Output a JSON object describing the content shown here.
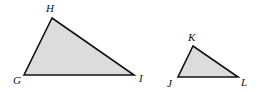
{
  "diagram": {
    "fill_color": "#dcdcdc",
    "stroke_color": "#111111",
    "triangles": [
      {
        "name": "triangle-GHI",
        "vertices": [
          {
            "label": "H",
            "x": 52,
            "y": 18,
            "lx": 46,
            "ly": 12
          },
          {
            "label": "G",
            "x": 24,
            "y": 75,
            "lx": 13,
            "ly": 84
          },
          {
            "label": "I",
            "x": 134,
            "y": 75,
            "lx": 139,
            "ly": 82
          }
        ]
      },
      {
        "name": "triangle-JKL",
        "vertices": [
          {
            "label": "K",
            "x": 193,
            "y": 46,
            "lx": 188,
            "ly": 41
          },
          {
            "label": "J",
            "x": 178,
            "y": 77,
            "lx": 167,
            "ly": 87
          },
          {
            "label": "L",
            "x": 238,
            "y": 77,
            "lx": 241,
            "ly": 86
          }
        ]
      }
    ]
  }
}
